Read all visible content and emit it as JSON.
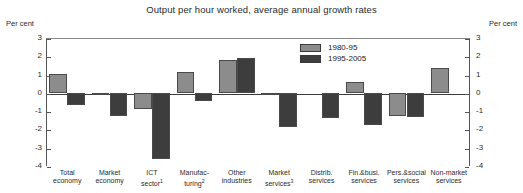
{
  "chart_data": {
    "type": "bar",
    "title": "Output per hour worked, average annual growth rates",
    "xlabel": "",
    "ylabel": "Per cent",
    "ylim": [
      -4,
      3
    ],
    "yticks": [
      3,
      2,
      1,
      0,
      -1,
      -2,
      -3,
      -4
    ],
    "grid": false,
    "legend_position": "top-center-right",
    "axis_unit_left": "Per cent",
    "axis_unit_right": "Per cent",
    "categories": [
      "Total economy",
      "Market economy",
      "ICT sector¹",
      "Manufac-turing²",
      "Other industries",
      "Market services³",
      "Distrib. services",
      "Fin.&busi. services",
      "Pers.&social services",
      "Non-market services"
    ],
    "category_lines": [
      [
        "Total",
        "economy",
        ""
      ],
      [
        "Market",
        "economy",
        ""
      ],
      [
        "ICT",
        "sector",
        "1"
      ],
      [
        "Manufac-",
        "turing",
        "2"
      ],
      [
        "Other",
        "industries",
        ""
      ],
      [
        "Market",
        "services",
        "3"
      ],
      [
        "Distrib.",
        "services",
        ""
      ],
      [
        "Fin.&busi.",
        "services",
        ""
      ],
      [
        "Pers.&social",
        "services",
        ""
      ],
      [
        "Non-market",
        "services",
        ""
      ]
    ],
    "series": [
      {
        "name": "1980-95",
        "color": "#8c8c8c",
        "values": [
          1.05,
          -0.05,
          -0.9,
          1.15,
          1.8,
          -0.05,
          null,
          0.6,
          -1.25,
          1.35
        ]
      },
      {
        "name": "1995-2005",
        "color": "#3d3d3d",
        "values": [
          -0.65,
          -1.25,
          -3.6,
          -0.45,
          1.9,
          -1.85,
          -1.35,
          -1.75,
          -1.3,
          null
        ]
      }
    ]
  }
}
